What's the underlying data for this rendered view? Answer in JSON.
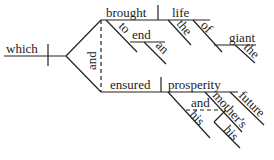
{
  "diagram": {
    "type": "Reed-Kellogg sentence diagram",
    "subject": "which",
    "conjunction": "and",
    "predicates": [
      {
        "verb": "brought",
        "object": "life",
        "object_modifiers": [
          "the"
        ],
        "preposition_phrases": [
          {
            "preposition": "to",
            "object": "end",
            "modifiers": [
              "an"
            ]
          },
          {
            "preposition": "of",
            "object": "giant",
            "modifiers": [
              "the"
            ]
          }
        ]
      },
      {
        "verb": "ensured",
        "object": "prosperity",
        "object_modifiers": [
          "future"
        ],
        "compound_modifier": {
          "conjunction": "and",
          "items": [
            {
              "word": "his"
            },
            {
              "word": "mother's",
              "modifiers": [
                "his"
              ]
            }
          ]
        }
      }
    ]
  },
  "labels": {
    "which": "which",
    "and_main": "and",
    "brought": "brought",
    "to": "to",
    "end": "end",
    "an": "an",
    "life": "life",
    "the1": "the",
    "of": "of",
    "giant": "giant",
    "the2": "the",
    "ensured": "ensured",
    "prosperity": "prosperity",
    "and_mod": "and",
    "his1": "his",
    "mothers": "mother's",
    "his2": "his",
    "future": "future"
  }
}
